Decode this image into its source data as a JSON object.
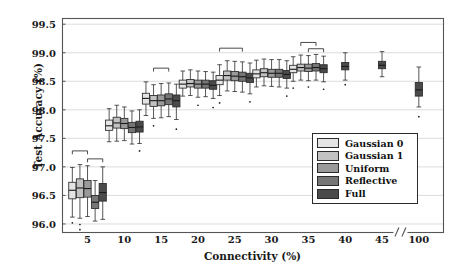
{
  "chart_data": {
    "type": "box",
    "title": "",
    "xlabel": "Connectivity (%)",
    "ylabel": "Test Accuracy (%)",
    "ylim": [
      95.85,
      99.6
    ],
    "yticks": [
      96.0,
      96.5,
      97.0,
      97.5,
      98.0,
      98.5,
      99.0,
      99.5
    ],
    "ytick_labels": [
      "96.0",
      "96.5",
      "97.0",
      "97.5",
      "98.0",
      "98.5",
      "99.0",
      "99.5"
    ],
    "xticks": [
      5,
      10,
      15,
      20,
      25,
      30,
      35,
      40,
      45,
      100
    ],
    "xtick_labels": [
      "5",
      "10",
      "15",
      "20",
      "25",
      "30",
      "35",
      "40",
      "45",
      "100"
    ],
    "axis_break": {
      "present": true,
      "between": [
        "45",
        "100"
      ],
      "marker": "//"
    },
    "grid": {
      "horizontal": true,
      "vertical": false,
      "color": "#d8d8d8"
    },
    "legend": {
      "position": "lower-right-inside",
      "entries": [
        {
          "name": "Gaussian 0",
          "color": "#e4e4e4"
        },
        {
          "name": "Gaussian 1",
          "color": "#c2c2c2"
        },
        {
          "name": "Uniform",
          "color": "#9a9a9a"
        },
        {
          "name": "Reflective",
          "color": "#767676"
        },
        {
          "name": "Full",
          "color": "#4a4a4a"
        }
      ]
    },
    "series": [
      {
        "name": "Gaussian 0",
        "color": "#e4e4e4"
      },
      {
        "name": "Gaussian 1",
        "color": "#c2c2c2"
      },
      {
        "name": "Uniform",
        "color": "#9a9a9a"
      },
      {
        "name": "Reflective",
        "color": "#767676"
      },
      {
        "name": "Full",
        "color": "#4a4a4a"
      }
    ],
    "groups": [
      {
        "category": "5",
        "boxes": [
          {
            "series": "Gaussian 0",
            "whisker_low": 96.12,
            "q1": 96.44,
            "median": 96.59,
            "q3": 96.73,
            "whisker_high": 96.99,
            "outliers": [
              96.02
            ]
          },
          {
            "series": "Gaussian 1",
            "whisker_low": 96.1,
            "q1": 96.46,
            "median": 96.63,
            "q3": 96.79,
            "whisker_high": 97.04,
            "outliers": [
              95.99,
              95.9
            ]
          },
          {
            "series": "Uniform",
            "whisker_low": 96.13,
            "q1": 96.47,
            "median": 96.62,
            "q3": 96.76,
            "whisker_high": 97.02,
            "outliers": []
          },
          {
            "series": "Reflective",
            "whisker_low": 96.05,
            "q1": 96.27,
            "median": 96.38,
            "q3": 96.5,
            "whisker_high": 96.76,
            "outliers": []
          },
          {
            "series": "Full",
            "whisker_low": 96.08,
            "q1": 96.4,
            "median": 96.55,
            "q3": 96.71,
            "whisker_high": 97.0,
            "outliers": []
          }
        ],
        "brackets": [
          {
            "from": 0,
            "to": 2,
            "y": 97.28
          },
          {
            "from": 2,
            "to": 4,
            "y": 97.14
          }
        ]
      },
      {
        "category": "10",
        "boxes": [
          {
            "series": "Gaussian 0",
            "whisker_low": 97.44,
            "q1": 97.64,
            "median": 97.72,
            "q3": 97.82,
            "whisker_high": 98.02,
            "outliers": []
          },
          {
            "series": "Gaussian 1",
            "whisker_low": 97.45,
            "q1": 97.68,
            "median": 97.77,
            "q3": 97.87,
            "whisker_high": 98.08,
            "outliers": []
          },
          {
            "series": "Uniform",
            "whisker_low": 97.46,
            "q1": 97.67,
            "median": 97.76,
            "q3": 97.85,
            "whisker_high": 98.05,
            "outliers": []
          },
          {
            "series": "Reflective",
            "whisker_low": 97.4,
            "q1": 97.6,
            "median": 97.69,
            "q3": 97.78,
            "whisker_high": 97.98,
            "outliers": []
          },
          {
            "series": "Full",
            "whisker_low": 97.41,
            "q1": 97.61,
            "median": 97.7,
            "q3": 97.8,
            "whisker_high": 98.0,
            "outliers": [
              97.28
            ]
          }
        ],
        "brackets": []
      },
      {
        "category": "15",
        "boxes": [
          {
            "series": "Gaussian 0",
            "whisker_low": 97.9,
            "q1": 98.1,
            "median": 98.2,
            "q3": 98.29,
            "whisker_high": 98.49,
            "outliers": []
          },
          {
            "series": "Gaussian 1",
            "whisker_low": 97.85,
            "q1": 98.06,
            "median": 98.16,
            "q3": 98.25,
            "whisker_high": 98.44,
            "outliers": [
              97.72
            ]
          },
          {
            "series": "Uniform",
            "whisker_low": 97.86,
            "q1": 98.07,
            "median": 98.16,
            "q3": 98.26,
            "whisker_high": 98.46,
            "outliers": []
          },
          {
            "series": "Reflective",
            "whisker_low": 97.88,
            "q1": 98.09,
            "median": 98.19,
            "q3": 98.28,
            "whisker_high": 98.47,
            "outliers": []
          },
          {
            "series": "Full",
            "whisker_low": 97.83,
            "q1": 98.05,
            "median": 98.16,
            "q3": 98.26,
            "whisker_high": 98.45,
            "outliers": [
              97.66
            ]
          }
        ],
        "brackets": [
          {
            "from": 1,
            "to": 3,
            "y": 98.73
          }
        ]
      },
      {
        "category": "20",
        "boxes": [
          {
            "series": "Gaussian 0",
            "whisker_low": 98.24,
            "q1": 98.38,
            "median": 98.45,
            "q3": 98.52,
            "whisker_high": 98.68,
            "outliers": []
          },
          {
            "series": "Gaussian 1",
            "whisker_low": 98.25,
            "q1": 98.4,
            "median": 98.46,
            "q3": 98.53,
            "whisker_high": 98.7,
            "outliers": []
          },
          {
            "series": "Uniform",
            "whisker_low": 98.22,
            "q1": 98.38,
            "median": 98.45,
            "q3": 98.52,
            "whisker_high": 98.68,
            "outliers": [
              98.08
            ]
          },
          {
            "series": "Reflective",
            "whisker_low": 98.23,
            "q1": 98.38,
            "median": 98.45,
            "q3": 98.52,
            "whisker_high": 98.67,
            "outliers": []
          },
          {
            "series": "Full",
            "whisker_low": 98.2,
            "q1": 98.36,
            "median": 98.43,
            "q3": 98.51,
            "whisker_high": 98.66,
            "outliers": [
              98.04
            ]
          }
        ],
        "brackets": []
      },
      {
        "category": "25",
        "boxes": [
          {
            "series": "Gaussian 0",
            "whisker_low": 98.25,
            "q1": 98.44,
            "median": 98.52,
            "q3": 98.6,
            "whisker_high": 98.79,
            "outliers": [
              98.12
            ]
          },
          {
            "series": "Gaussian 1",
            "whisker_low": 98.33,
            "q1": 98.52,
            "median": 98.6,
            "q3": 98.68,
            "whisker_high": 98.86,
            "outliers": []
          },
          {
            "series": "Uniform",
            "whisker_low": 98.32,
            "q1": 98.51,
            "median": 98.59,
            "q3": 98.67,
            "whisker_high": 98.85,
            "outliers": []
          },
          {
            "series": "Reflective",
            "whisker_low": 98.31,
            "q1": 98.5,
            "median": 98.58,
            "q3": 98.66,
            "whisker_high": 98.84,
            "outliers": []
          },
          {
            "series": "Full",
            "whisker_low": 98.28,
            "q1": 98.48,
            "median": 98.56,
            "q3": 98.64,
            "whisker_high": 98.82,
            "outliers": [
              98.14
            ]
          }
        ],
        "brackets": [
          {
            "from": 0,
            "to": 3,
            "y": 99.08
          }
        ]
      },
      {
        "category": "30",
        "boxes": [
          {
            "series": "Gaussian 0",
            "whisker_low": 98.4,
            "q1": 98.56,
            "median": 98.63,
            "q3": 98.7,
            "whisker_high": 98.87,
            "outliers": []
          },
          {
            "series": "Gaussian 1",
            "whisker_low": 98.42,
            "q1": 98.58,
            "median": 98.65,
            "q3": 98.72,
            "whisker_high": 98.89,
            "outliers": []
          },
          {
            "series": "Uniform",
            "whisker_low": 98.41,
            "q1": 98.57,
            "median": 98.64,
            "q3": 98.71,
            "whisker_high": 98.88,
            "outliers": []
          },
          {
            "series": "Reflective",
            "whisker_low": 98.4,
            "q1": 98.57,
            "median": 98.64,
            "q3": 98.71,
            "whisker_high": 98.88,
            "outliers": []
          },
          {
            "series": "Full",
            "whisker_low": 98.38,
            "q1": 98.55,
            "median": 98.62,
            "q3": 98.69,
            "whisker_high": 98.86,
            "outliers": [
              98.24
            ]
          }
        ],
        "brackets": []
      },
      {
        "category": "35",
        "boxes": [
          {
            "series": "Gaussian 0",
            "whisker_low": 98.5,
            "q1": 98.65,
            "median": 98.71,
            "q3": 98.78,
            "whisker_high": 98.93,
            "outliers": [
              98.38
            ]
          },
          {
            "series": "Gaussian 1",
            "whisker_low": 98.52,
            "q1": 98.68,
            "median": 98.74,
            "q3": 98.8,
            "whisker_high": 98.96,
            "outliers": []
          },
          {
            "series": "Uniform",
            "whisker_low": 98.51,
            "q1": 98.67,
            "median": 98.73,
            "q3": 98.8,
            "whisker_high": 98.95,
            "outliers": [
              98.4
            ]
          },
          {
            "series": "Reflective",
            "whisker_low": 98.52,
            "q1": 98.68,
            "median": 98.74,
            "q3": 98.81,
            "whisker_high": 98.97,
            "outliers": []
          },
          {
            "series": "Full",
            "whisker_low": 98.49,
            "q1": 98.65,
            "median": 98.72,
            "q3": 98.79,
            "whisker_high": 98.94,
            "outliers": [
              98.36
            ]
          }
        ],
        "brackets": [
          {
            "from": 1,
            "to": 3,
            "y": 99.18
          },
          {
            "from": 2,
            "to": 4,
            "y": 99.07
          }
        ]
      },
      {
        "category": "40",
        "boxes": [
          {
            "series": "Full",
            "whisker_low": 98.52,
            "q1": 98.7,
            "median": 98.76,
            "q3": 98.83,
            "whisker_high": 99.0,
            "outliers": [
              98.44
            ]
          }
        ],
        "brackets": []
      },
      {
        "category": "45",
        "boxes": [
          {
            "series": "Full",
            "whisker_low": 98.58,
            "q1": 98.72,
            "median": 98.78,
            "q3": 98.85,
            "whisker_high": 99.02,
            "outliers": []
          }
        ],
        "brackets": []
      },
      {
        "category": "100",
        "boxes": [
          {
            "series": "Full",
            "whisker_low": 98.05,
            "q1": 98.24,
            "median": 98.35,
            "q3": 98.48,
            "whisker_high": 98.75,
            "outliers": [
              97.88
            ]
          }
        ],
        "brackets": []
      }
    ]
  },
  "axes": {
    "ylabel": "Test Accuracy (%)",
    "xlabel": "Connectivity (%)"
  }
}
